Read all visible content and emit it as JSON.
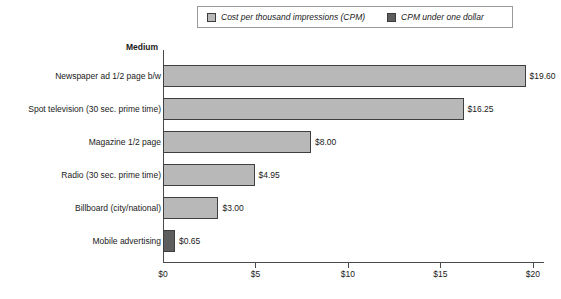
{
  "legend": {
    "entries": [
      {
        "label": "Cost per thousand impressions (CPM)",
        "swatch": "light-gray-swatch",
        "color": "#b8b8b8"
      },
      {
        "label": "CPM under one dollar",
        "swatch": "dark-gray-swatch",
        "color": "#5e5e5e"
      }
    ]
  },
  "chart_data": {
    "type": "bar",
    "orientation": "horizontal",
    "title": "",
    "ylabel": "Medium",
    "xlabel": "",
    "categories": [
      "Newspaper ad 1/2 page b/w",
      "Spot television (30 sec. prime time)",
      "Magazine 1/2 page",
      "Radio (30 sec. prime time)",
      "Billboard (city/national)",
      "Mobile advertising"
    ],
    "values": [
      19.6,
      16.25,
      8.0,
      4.95,
      3.0,
      0.65
    ],
    "value_labels": [
      "$19.60",
      "$16.25",
      "$8.00",
      "$4.95",
      "$3.00",
      "$0.65"
    ],
    "series_of": [
      "Cost per thousand impressions (CPM)",
      "Cost per thousand impressions (CPM)",
      "Cost per thousand impressions (CPM)",
      "Cost per thousand impressions (CPM)",
      "Cost per thousand impressions (CPM)",
      "CPM under one dollar"
    ],
    "bar_colors": [
      "#b8b8b8",
      "#b8b8b8",
      "#b8b8b8",
      "#b8b8b8",
      "#b8b8b8",
      "#5e5e5e"
    ],
    "xlim": [
      0,
      20.6
    ],
    "xticks": [
      0,
      5,
      10,
      15,
      20
    ],
    "xtick_labels": [
      "$0",
      "$5",
      "$10",
      "$15",
      "$20"
    ],
    "grid": false,
    "legend_position": "top-center"
  }
}
